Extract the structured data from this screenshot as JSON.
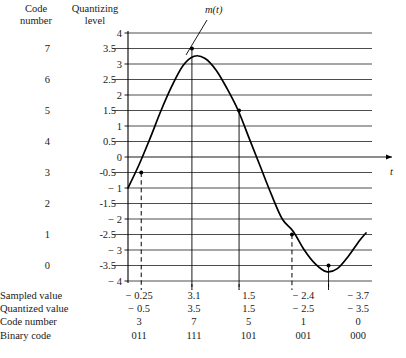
{
  "headers": {
    "code_number": "Code\nnumber",
    "quantizing_level": "Quantizing\nlevel"
  },
  "axis": {
    "signal_label": "m(t)",
    "time_label": "t",
    "y_ticks": [
      "4",
      "3",
      "2",
      "1",
      "0",
      "-1",
      "-2",
      "-3",
      "-4"
    ],
    "y_min": -4,
    "y_max": 4
  },
  "levels": [
    {
      "code": "7",
      "level": "3.5",
      "value": 3.5
    },
    {
      "code": "6",
      "level": "2.5",
      "value": 2.5
    },
    {
      "code": "5",
      "level": "1.5",
      "value": 1.5
    },
    {
      "code": "4",
      "level": "0.5",
      "value": 0.5
    },
    {
      "code": "3",
      "level": "-0.5",
      "value": -0.5
    },
    {
      "code": "2",
      "level": "-1.5",
      "value": -1.5
    },
    {
      "code": "1",
      "level": "-2.5",
      "value": -2.5
    },
    {
      "code": "0",
      "level": "-3.5",
      "value": -3.5
    }
  ],
  "table": {
    "rows": [
      {
        "label": "Sampled value",
        "values": [
          "-0.25",
          "3.1",
          "1.5",
          "-2.4",
          "-3.7"
        ]
      },
      {
        "label": "Quantized value",
        "values": [
          "-0.5",
          "3.5",
          "1.5",
          "-2.5",
          "-3.5"
        ]
      },
      {
        "label": "Code number",
        "values": [
          "3",
          "7",
          "5",
          "1",
          "0"
        ]
      },
      {
        "label": "Binary code",
        "values": [
          "011",
          "111",
          "101",
          "001",
          "000"
        ]
      }
    ]
  },
  "chart_data": {
    "type": "line",
    "title": "",
    "xlabel": "t",
    "ylabel": "",
    "ylim": [
      -4,
      4
    ],
    "grid": true,
    "legend": "none",
    "series": [
      {
        "name": "m(t)",
        "points": [
          [
            0.0,
            -1.0
          ],
          [
            0.25,
            -0.25
          ],
          [
            0.5,
            0.6
          ],
          [
            0.75,
            1.5
          ],
          [
            1.0,
            2.3
          ],
          [
            1.25,
            2.95
          ],
          [
            1.5,
            3.25
          ],
          [
            1.75,
            3.18
          ],
          [
            2.0,
            2.8
          ],
          [
            2.25,
            2.2
          ],
          [
            2.5,
            1.5
          ],
          [
            2.75,
            0.6
          ],
          [
            3.0,
            -0.3
          ],
          [
            3.25,
            -1.2
          ],
          [
            3.5,
            -2.0
          ],
          [
            3.75,
            -2.4
          ],
          [
            4.0,
            -3.0
          ],
          [
            4.25,
            -3.45
          ],
          [
            4.5,
            -3.7
          ],
          [
            4.75,
            -3.6
          ],
          [
            5.0,
            -3.2
          ],
          [
            5.25,
            -2.7
          ],
          [
            5.4,
            -2.45
          ]
        ]
      }
    ],
    "samples": [
      {
        "t": 0.3,
        "sampled": -0.25,
        "quantized": -0.5,
        "code": 3,
        "binary": "011"
      },
      {
        "t": 1.45,
        "sampled": 3.1,
        "quantized": 3.5,
        "code": 7,
        "binary": "111"
      },
      {
        "t": 2.52,
        "sampled": 1.5,
        "quantized": 1.5,
        "code": 5,
        "binary": "101"
      },
      {
        "t": 3.72,
        "sampled": -2.4,
        "quantized": -2.5,
        "code": 1,
        "binary": "001"
      },
      {
        "t": 4.55,
        "sampled": -3.7,
        "quantized": -3.5,
        "code": 0,
        "binary": "000"
      }
    ],
    "quantizing_levels": [
      3.5,
      2.5,
      1.5,
      0.5,
      -0.5,
      -1.5,
      -2.5,
      -3.5
    ],
    "code_numbers": [
      7,
      6,
      5,
      4,
      3,
      2,
      1,
      0
    ]
  }
}
